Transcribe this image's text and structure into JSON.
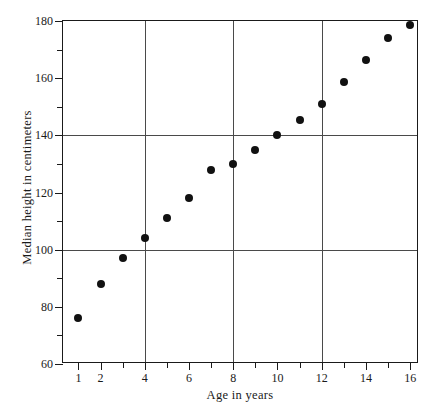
{
  "chart_data": {
    "type": "scatter",
    "title": "",
    "xlabel": "Age in years",
    "ylabel": "Median height in centimeters",
    "xlim": [
      0.3,
      16.4
    ],
    "ylim": [
      60,
      180
    ],
    "grid": true,
    "grid_x_values": [
      4,
      8,
      12
    ],
    "grid_y_values": [
      100,
      140
    ],
    "legend": null,
    "x_major_ticks": [
      1,
      2,
      4,
      6,
      8,
      10,
      12,
      14,
      16
    ],
    "x_minor_ticks": [
      3,
      5,
      7,
      9,
      11,
      13,
      15
    ],
    "x_ticklabels": [
      "1",
      "2",
      "4",
      "6",
      "8",
      "10",
      "12",
      "14",
      "16"
    ],
    "y_major_ticks": [
      60,
      80,
      100,
      120,
      140,
      160,
      180
    ],
    "y_minor_ticks": [
      70,
      90,
      110,
      130,
      150,
      170
    ],
    "y_ticklabels": [
      "60",
      "80",
      "100",
      "120",
      "140",
      "160",
      "180"
    ],
    "x": [
      1,
      2,
      3,
      4,
      5,
      6,
      7,
      8,
      9,
      10,
      11,
      12,
      13,
      14,
      15,
      16
    ],
    "y": [
      76,
      88,
      97,
      104,
      111,
      118,
      128,
      130,
      135,
      140,
      145.5,
      151,
      158.5,
      166.5,
      174,
      178.5
    ],
    "points": [
      {
        "age": 1,
        "height": 76
      },
      {
        "age": 2,
        "height": 88
      },
      {
        "age": 3,
        "height": 97
      },
      {
        "age": 4,
        "height": 104
      },
      {
        "age": 5,
        "height": 111
      },
      {
        "age": 6,
        "height": 118
      },
      {
        "age": 7,
        "height": 128
      },
      {
        "age": 8,
        "height": 130
      },
      {
        "age": 9,
        "height": 135
      },
      {
        "age": 10,
        "height": 140
      },
      {
        "age": 11,
        "height": 145.5
      },
      {
        "age": 12,
        "height": 151
      },
      {
        "age": 13,
        "height": 158.5
      },
      {
        "age": 14,
        "height": 166.5
      },
      {
        "age": 15,
        "height": 174
      },
      {
        "age": 16,
        "height": 178.5
      }
    ],
    "marker": "filled-circle",
    "marker_color": "#111111"
  },
  "figure": {
    "caption": ""
  }
}
